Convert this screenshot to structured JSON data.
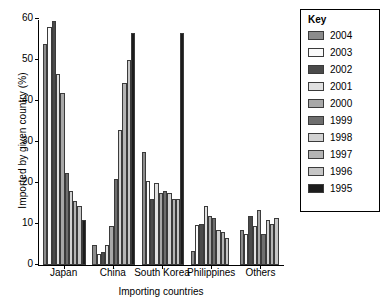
{
  "chart_data": {
    "type": "bar",
    "title": "",
    "xlabel": "Importing countries",
    "ylabel": "Imported by given country (%)",
    "categories": [
      "Japan",
      "China",
      "South Korea",
      "Philippines",
      "Others"
    ],
    "ylim": [
      0,
      60
    ],
    "yticks": [
      0,
      10,
      20,
      30,
      40,
      50,
      60
    ],
    "grid": false,
    "legend_title": "Key",
    "legend_position": "right",
    "series": [
      {
        "name": "2004",
        "color": "#8c8c8c",
        "values": [
          54.0,
          4.8,
          27.5,
          3.5,
          8.5
        ]
      },
      {
        "name": "2003",
        "color": "#fafafa",
        "values": [
          58.0,
          2.8,
          20.5,
          9.8,
          7.5
        ]
      },
      {
        "name": "2002",
        "color": "#4a4a4a",
        "values": [
          59.5,
          3.2,
          16.0,
          10.0,
          12.0
        ]
      },
      {
        "name": "2001",
        "color": "#e0e0e0",
        "values": [
          46.5,
          5.0,
          20.0,
          14.5,
          9.5
        ]
      },
      {
        "name": "2000",
        "color": "#a8a8a8",
        "values": [
          42.0,
          9.5,
          17.5,
          12.0,
          13.5
        ]
      },
      {
        "name": "1999",
        "color": "#6e6e6e",
        "values": [
          22.5,
          21.0,
          18.0,
          11.5,
          7.5
        ]
      },
      {
        "name": "1998",
        "color": "#d2d2d2",
        "values": [
          18.0,
          33.0,
          17.5,
          8.5,
          11.0
        ]
      },
      {
        "name": "1997",
        "color": "#b4b4b4",
        "values": [
          15.5,
          44.5,
          16.0,
          8.0,
          10.0
        ]
      },
      {
        "name": "1996",
        "color": "#c6c6c6",
        "values": [
          14.5,
          50.0,
          16.0,
          6.5,
          11.5
        ]
      },
      {
        "name": "1995",
        "color": "#1c1c1c",
        "values": [
          11.0,
          56.5,
          56.5,
          0.0,
          0.0
        ]
      }
    ]
  },
  "notes": {
    "axis_line_color": "#000000",
    "background": "#ffffff"
  }
}
